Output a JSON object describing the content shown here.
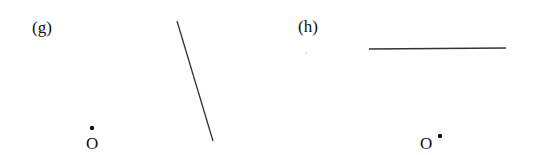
{
  "panels": [
    {
      "id": "g",
      "label": "(g)",
      "label_pos": [
        32,
        33
      ],
      "segment": {
        "x1": 177,
        "y1": 21,
        "x2": 213,
        "y2": 141
      },
      "point": {
        "name": "O",
        "x": 92,
        "y": 128,
        "label_x": 86,
        "label_y": 149
      }
    },
    {
      "id": "h",
      "label": "(h)",
      "label_pos": [
        298,
        32
      ],
      "segment": {
        "x1": 369,
        "y1": 49,
        "x2": 506,
        "y2": 48
      },
      "point": {
        "name": "O",
        "x": 440,
        "y": 136,
        "label_x": 420,
        "label_y": 149
      }
    }
  ],
  "colors": {
    "ink": "#111111",
    "line": "#333333",
    "background": "#ffffff"
  }
}
